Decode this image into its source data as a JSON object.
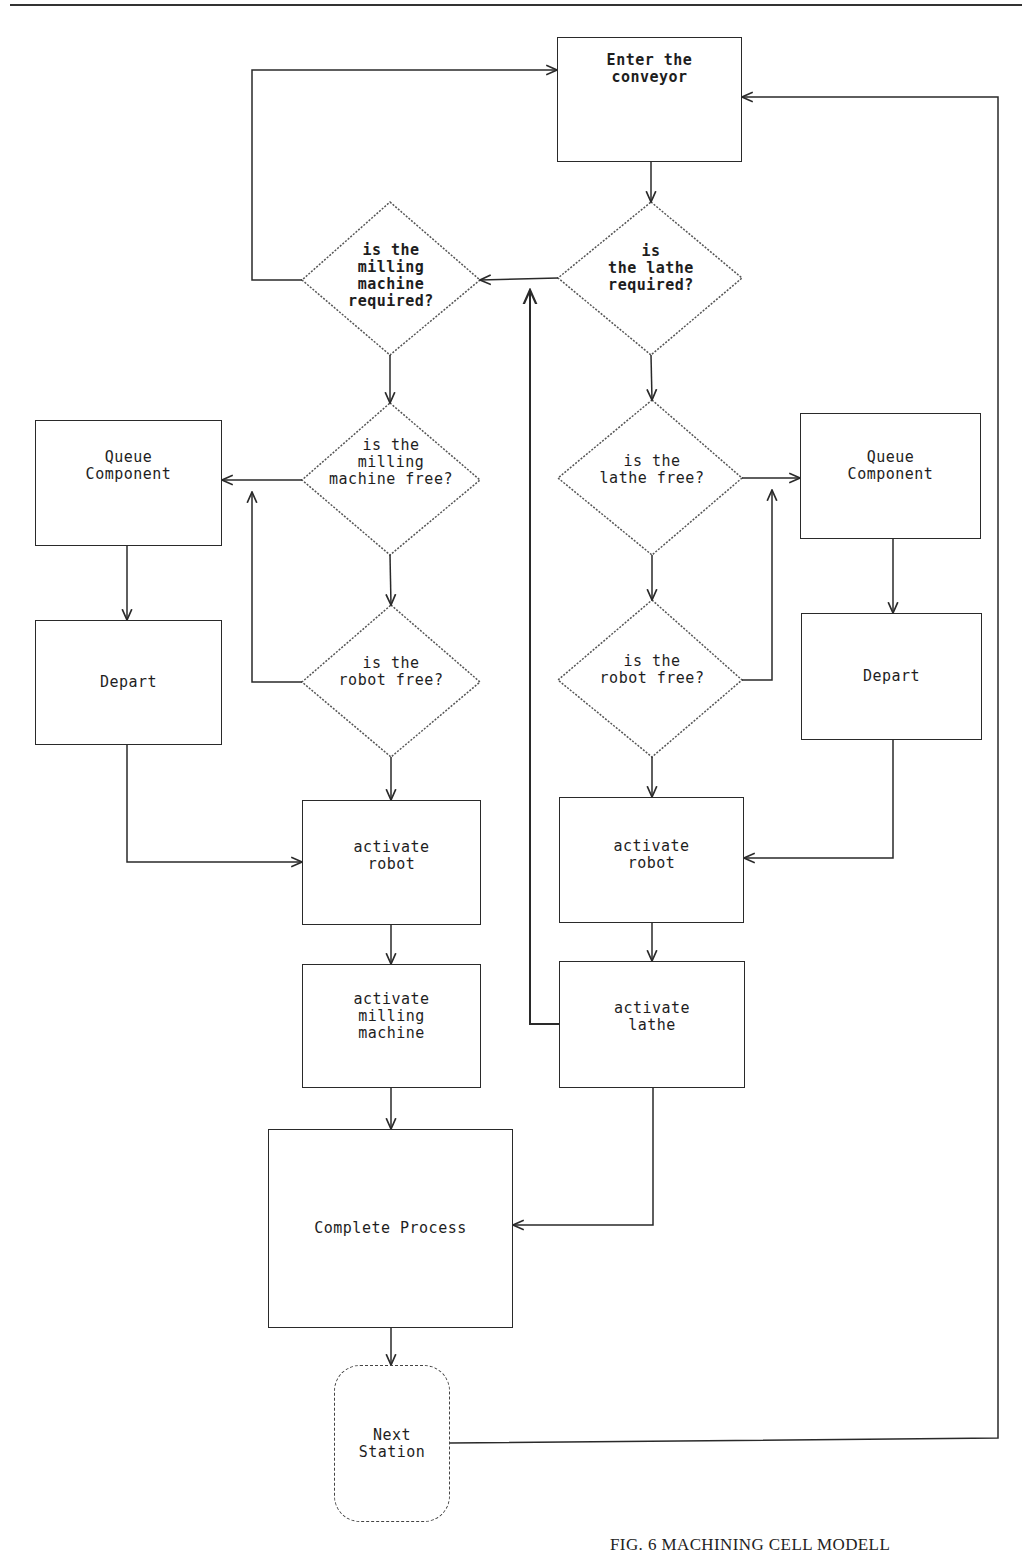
{
  "figure": {
    "caption": "FIG. 6 MACHINING CELL MODELL",
    "line_color": "#2a2a2a",
    "background": "#ffffff"
  },
  "nodes": {
    "enter_conveyor": {
      "label": "Enter the\nconveyor",
      "shape": "process"
    },
    "lathe_required": {
      "label": "is\nthe lathe\nrequired?",
      "shape": "decision"
    },
    "milling_required": {
      "label": "is the\nmilling\nmachine\nrequired?",
      "shape": "decision"
    },
    "milling_free": {
      "label": "is the\nmilling\nmachine free?",
      "shape": "decision"
    },
    "robot_free_left": {
      "label": "is the\nrobot free?",
      "shape": "decision"
    },
    "lathe_free": {
      "label": "is the\nlathe free?",
      "shape": "decision"
    },
    "robot_free_right": {
      "label": "is the\nrobot free?",
      "shape": "decision"
    },
    "queue_left": {
      "label": "Queue\nComponent",
      "shape": "process"
    },
    "depart_left": {
      "label": "Depart",
      "shape": "process"
    },
    "queue_right": {
      "label": "Queue\nComponent",
      "shape": "process"
    },
    "depart_right": {
      "label": "Depart",
      "shape": "process"
    },
    "activate_robot_left": {
      "label": "activate\nrobot",
      "shape": "process"
    },
    "activate_milling": {
      "label": "activate\nmilling\nmachine",
      "shape": "process"
    },
    "activate_robot_right": {
      "label": "activate\nrobot",
      "shape": "process"
    },
    "activate_lathe": {
      "label": "activate\nlathe",
      "shape": "process"
    },
    "complete_process": {
      "label": "Complete Process",
      "shape": "process"
    },
    "next_station": {
      "label": "Next\nStation",
      "shape": "terminal"
    }
  },
  "edges": [
    {
      "from": "enter_conveyor",
      "to": "lathe_required"
    },
    {
      "from": "lathe_required",
      "to": "milling_required",
      "branch": "no"
    },
    {
      "from": "lathe_required",
      "to": "lathe_free",
      "branch": "yes"
    },
    {
      "from": "milling_required",
      "to": "enter_conveyor",
      "branch": "no"
    },
    {
      "from": "milling_required",
      "to": "milling_free",
      "branch": "yes"
    },
    {
      "from": "milling_free",
      "to": "queue_left",
      "branch": "no"
    },
    {
      "from": "milling_free",
      "to": "robot_free_left",
      "branch": "yes"
    },
    {
      "from": "robot_free_left",
      "to": "queue_left",
      "branch": "no"
    },
    {
      "from": "robot_free_left",
      "to": "activate_robot_left",
      "branch": "yes"
    },
    {
      "from": "queue_left",
      "to": "depart_left"
    },
    {
      "from": "depart_left",
      "to": "activate_robot_left"
    },
    {
      "from": "activate_robot_left",
      "to": "activate_milling"
    },
    {
      "from": "activate_milling",
      "to": "complete_process"
    },
    {
      "from": "lathe_free",
      "to": "queue_right",
      "branch": "no"
    },
    {
      "from": "lathe_free",
      "to": "robot_free_right",
      "branch": "yes"
    },
    {
      "from": "robot_free_right",
      "to": "queue_right",
      "branch": "no"
    },
    {
      "from": "robot_free_right",
      "to": "activate_robot_right",
      "branch": "yes"
    },
    {
      "from": "queue_right",
      "to": "depart_right"
    },
    {
      "from": "depart_right",
      "to": "activate_robot_right"
    },
    {
      "from": "activate_robot_right",
      "to": "activate_lathe"
    },
    {
      "from": "activate_lathe",
      "to": "milling_required"
    },
    {
      "from": "activate_lathe",
      "to": "complete_process"
    },
    {
      "from": "complete_process",
      "to": "next_station"
    },
    {
      "from": "next_station",
      "to": "enter_conveyor"
    }
  ]
}
